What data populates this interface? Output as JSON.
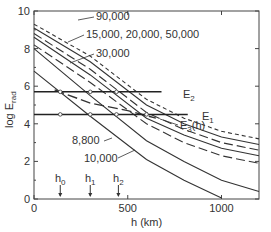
{
  "chart_data": {
    "type": "line",
    "title": "",
    "xlabel": "h (km)",
    "ylabel": "log E_rad",
    "xlim": [
      0,
      1200
    ],
    "ylim": [
      0,
      10
    ],
    "x_ticks": [
      "0",
      "500",
      "1000"
    ],
    "y_ticks": [
      "0",
      "2",
      "4",
      "6",
      "8",
      "10"
    ],
    "series": [
      {
        "name": "90,000",
        "style": "short-dash",
        "points": [
          [
            0,
            9.3
          ],
          [
            300,
            7.6
          ],
          [
            600,
            5.3
          ],
          [
            800,
            4.3
          ],
          [
            1000,
            3.6
          ],
          [
            1200,
            3.2
          ]
        ]
      },
      {
        "name": "50,000",
        "style": "solid",
        "points": [
          [
            0,
            9.1
          ],
          [
            300,
            7.3
          ],
          [
            600,
            5.0
          ],
          [
            800,
            4.0
          ],
          [
            1000,
            3.3
          ],
          [
            1200,
            2.9
          ]
        ]
      },
      {
        "name": "20,000",
        "style": "long-dash",
        "points": [
          [
            0,
            8.8
          ],
          [
            300,
            6.9
          ],
          [
            600,
            4.6
          ],
          [
            800,
            3.7
          ],
          [
            1000,
            3.0
          ],
          [
            1200,
            2.6
          ]
        ]
      },
      {
        "name": "15,000",
        "style": "solid",
        "points": [
          [
            0,
            8.6
          ],
          [
            300,
            6.6
          ],
          [
            600,
            4.3
          ],
          [
            800,
            3.4
          ],
          [
            1000,
            2.7
          ],
          [
            1200,
            2.3
          ]
        ]
      },
      {
        "name": "30,000",
        "style": "long-dash",
        "points": [
          [
            0,
            8.2
          ],
          [
            300,
            6.2
          ],
          [
            600,
            4.0
          ],
          [
            800,
            3.0
          ],
          [
            1000,
            2.3
          ],
          [
            1200,
            1.9
          ]
        ]
      },
      {
        "name": "10,000",
        "style": "solid",
        "points": [
          [
            0,
            8.0
          ],
          [
            300,
            5.5
          ],
          [
            600,
            3.1
          ],
          [
            800,
            2.0
          ],
          [
            1000,
            1.0
          ],
          [
            1200,
            0.4
          ]
        ]
      },
      {
        "name": "8,800",
        "style": "solid",
        "points": [
          [
            0,
            6.8
          ],
          [
            300,
            4.4
          ],
          [
            600,
            2.1
          ],
          [
            800,
            1.0
          ],
          [
            1000,
            0.05
          ]
        ]
      }
    ],
    "horizontal_lines": [
      {
        "name": "E2",
        "y": 5.7,
        "x_end": 680
      },
      {
        "name": "E1",
        "y": 4.5,
        "x_end": 820
      }
    ],
    "E3_curve": {
      "name": "E3(h)",
      "style": "long-dash",
      "points": [
        [
          110,
          5.8
        ],
        [
          300,
          5.1
        ],
        [
          500,
          4.7
        ],
        [
          650,
          4.3
        ]
      ]
    },
    "markers": [
      {
        "label": "h0",
        "x": 140
      },
      {
        "label": "h1",
        "x": 300
      },
      {
        "label": "h2",
        "x": 450
      }
    ],
    "series_labels": {
      "top": "90,000",
      "mid": "15,000, 20,000, 50,000",
      "third": "30,000",
      "low1": "8,800",
      "low2": "10,000"
    }
  },
  "labels": {
    "xlabel": "h (km)",
    "ylabel_main": "log E",
    "ylabel_sub": "rad",
    "e2": "E",
    "e2_sub": "2",
    "e1": "E",
    "e1_sub": "1",
    "e3": "E",
    "e3_sub": "3",
    "e3_suffix": "(h)",
    "l90": "90,000",
    "l15": "15,000, 20,000, 50,000",
    "l30": "30,000",
    "l88": "8,800",
    "l10": "10,000",
    "h0": "h",
    "h0s": "0",
    "h1": "h",
    "h1s": "1",
    "h2": "h",
    "h2s": "2"
  }
}
